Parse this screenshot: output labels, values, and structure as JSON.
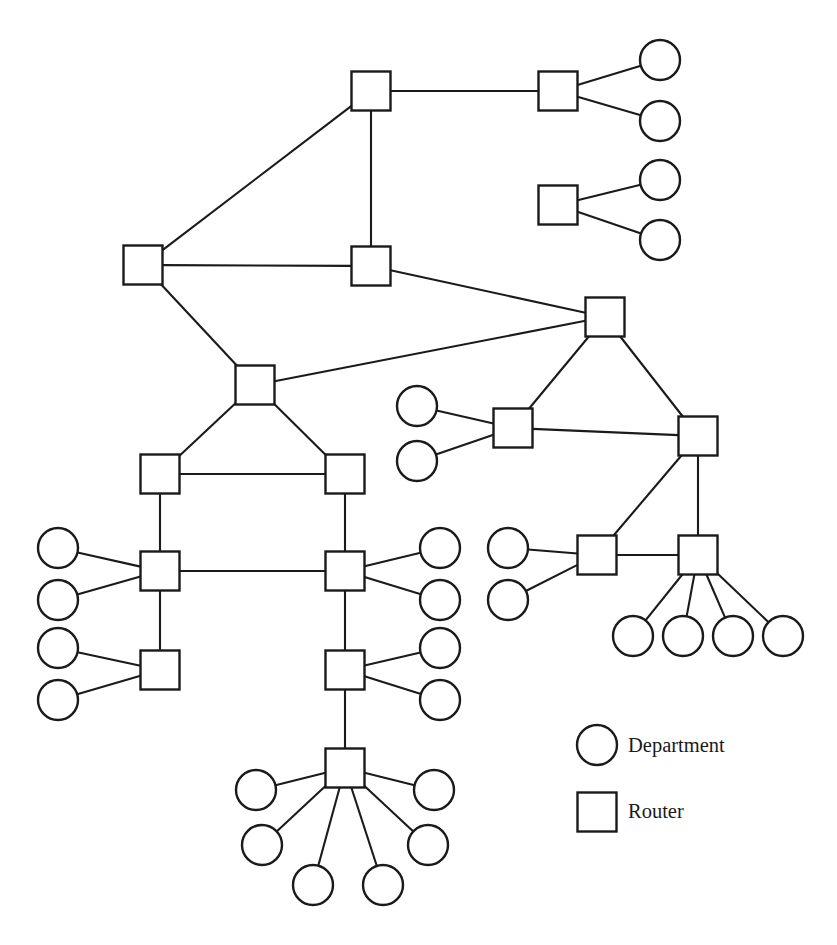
{
  "diagram": {
    "type": "node-link-graph",
    "width": 837,
    "height": 945,
    "background_color": "#ffffff",
    "line_color": "#1a1a1a",
    "node_fill_color": "#ffffff"
  },
  "shapes": {
    "router_size": 39,
    "department_radius": 20,
    "stroke_width": 2.4,
    "edge_width": 2.1
  },
  "legend": {
    "items": [
      {
        "id": "legend-department",
        "glyph": "circle",
        "label": "Department",
        "cx": 597,
        "cy": 745,
        "text_x": 628,
        "text_y": 747
      },
      {
        "id": "legend-router",
        "glyph": "square",
        "label": "Router",
        "cx": 597,
        "cy": 812,
        "text_x": 628,
        "text_y": 813
      }
    ]
  },
  "routers": [
    {
      "id": "R1",
      "x": 371,
      "y": 91
    },
    {
      "id": "R2",
      "x": 558,
      "y": 91
    },
    {
      "id": "R3",
      "x": 558,
      "y": 205
    },
    {
      "id": "R4",
      "x": 143,
      "y": 265
    },
    {
      "id": "R5",
      "x": 371,
      "y": 266
    },
    {
      "id": "R6",
      "x": 605,
      "y": 317
    },
    {
      "id": "R7",
      "x": 255,
      "y": 385
    },
    {
      "id": "R8",
      "x": 513,
      "y": 428
    },
    {
      "id": "R9",
      "x": 698,
      "y": 436
    },
    {
      "id": "R10",
      "x": 160,
      "y": 474
    },
    {
      "id": "R11",
      "x": 345,
      "y": 474
    },
    {
      "id": "R12",
      "x": 160,
      "y": 571
    },
    {
      "id": "R13",
      "x": 345,
      "y": 571
    },
    {
      "id": "R14",
      "x": 597,
      "y": 555
    },
    {
      "id": "R15",
      "x": 698,
      "y": 555
    },
    {
      "id": "R16",
      "x": 160,
      "y": 670
    },
    {
      "id": "R17",
      "x": 345,
      "y": 670
    },
    {
      "id": "R18",
      "x": 345,
      "y": 768
    }
  ],
  "departments": [
    {
      "id": "D1",
      "x": 660,
      "y": 60
    },
    {
      "id": "D2",
      "x": 660,
      "y": 121
    },
    {
      "id": "D3",
      "x": 660,
      "y": 180
    },
    {
      "id": "D4",
      "x": 660,
      "y": 240
    },
    {
      "id": "D5",
      "x": 417,
      "y": 406
    },
    {
      "id": "D6",
      "x": 417,
      "y": 461
    },
    {
      "id": "D7",
      "x": 58,
      "y": 548
    },
    {
      "id": "D8",
      "x": 58,
      "y": 600
    },
    {
      "id": "D9",
      "x": 58,
      "y": 648
    },
    {
      "id": "D10",
      "x": 58,
      "y": 700
    },
    {
      "id": "D11",
      "x": 440,
      "y": 548
    },
    {
      "id": "D12",
      "x": 440,
      "y": 600
    },
    {
      "id": "D13",
      "x": 440,
      "y": 648
    },
    {
      "id": "D14",
      "x": 440,
      "y": 700
    },
    {
      "id": "D15",
      "x": 508,
      "y": 548
    },
    {
      "id": "D16",
      "x": 508,
      "y": 600
    },
    {
      "id": "D17",
      "x": 633,
      "y": 636
    },
    {
      "id": "D18",
      "x": 683,
      "y": 636
    },
    {
      "id": "D19",
      "x": 733,
      "y": 636
    },
    {
      "id": "D20",
      "x": 783,
      "y": 636
    },
    {
      "id": "D21",
      "x": 256,
      "y": 790
    },
    {
      "id": "D22",
      "x": 434,
      "y": 790
    },
    {
      "id": "D23",
      "x": 262,
      "y": 845
    },
    {
      "id": "D24",
      "x": 428,
      "y": 845
    },
    {
      "id": "D25",
      "x": 313,
      "y": 885
    },
    {
      "id": "D26",
      "x": 383,
      "y": 885
    }
  ],
  "edges": [
    {
      "from": "R1",
      "to": "R2"
    },
    {
      "from": "R1",
      "to": "R4"
    },
    {
      "from": "R1",
      "to": "R5"
    },
    {
      "from": "R2",
      "to": "D1"
    },
    {
      "from": "R2",
      "to": "D2"
    },
    {
      "from": "R3",
      "to": "D3"
    },
    {
      "from": "R3",
      "to": "D4"
    },
    {
      "from": "R4",
      "to": "R5"
    },
    {
      "from": "R4",
      "to": "R7"
    },
    {
      "from": "R5",
      "to": "R6"
    },
    {
      "from": "R6",
      "to": "R7"
    },
    {
      "from": "R6",
      "to": "R8"
    },
    {
      "from": "R6",
      "to": "R9"
    },
    {
      "from": "R7",
      "to": "R10"
    },
    {
      "from": "R7",
      "to": "R11"
    },
    {
      "from": "R8",
      "to": "D5"
    },
    {
      "from": "R8",
      "to": "D6"
    },
    {
      "from": "R8",
      "to": "R9"
    },
    {
      "from": "R9",
      "to": "R14"
    },
    {
      "from": "R9",
      "to": "R15"
    },
    {
      "from": "R10",
      "to": "R11"
    },
    {
      "from": "R10",
      "to": "R12"
    },
    {
      "from": "R11",
      "to": "R13"
    },
    {
      "from": "R12",
      "to": "R13"
    },
    {
      "from": "R12",
      "to": "R16"
    },
    {
      "from": "R12",
      "to": "D7"
    },
    {
      "from": "R12",
      "to": "D8"
    },
    {
      "from": "R16",
      "to": "D9"
    },
    {
      "from": "R16",
      "to": "D10"
    },
    {
      "from": "R13",
      "to": "D11"
    },
    {
      "from": "R13",
      "to": "D12"
    },
    {
      "from": "R13",
      "to": "R17"
    },
    {
      "from": "R17",
      "to": "D13"
    },
    {
      "from": "R17",
      "to": "D14"
    },
    {
      "from": "R17",
      "to": "R18"
    },
    {
      "from": "R14",
      "to": "D15"
    },
    {
      "from": "R14",
      "to": "D16"
    },
    {
      "from": "R14",
      "to": "R15"
    },
    {
      "from": "R15",
      "to": "D17"
    },
    {
      "from": "R15",
      "to": "D18"
    },
    {
      "from": "R15",
      "to": "D19"
    },
    {
      "from": "R15",
      "to": "D20"
    },
    {
      "from": "R18",
      "to": "D21"
    },
    {
      "from": "R18",
      "to": "D22"
    },
    {
      "from": "R18",
      "to": "D23"
    },
    {
      "from": "R18",
      "to": "D24"
    },
    {
      "from": "R18",
      "to": "D25"
    },
    {
      "from": "R18",
      "to": "D26"
    }
  ]
}
